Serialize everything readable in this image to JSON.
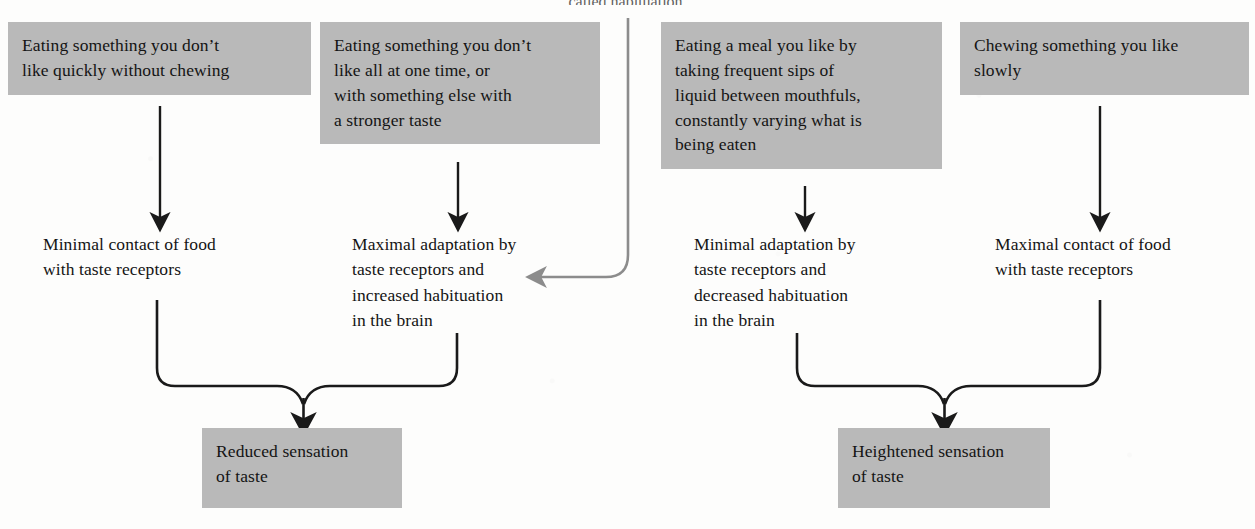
{
  "page": {
    "cutoff_heading": "called habituation.",
    "width": 1255,
    "height": 529
  },
  "colors": {
    "box_fill": "#b9b9b9",
    "text": "#141414",
    "arrow_black": "#1a1a1a",
    "arrow_gray": "#8c8c8c",
    "background": "#fdfdfc"
  },
  "nodes": {
    "cause_1": {
      "label": "Eating something you don’t\nlike quickly without chewing",
      "kind": "shaded-box"
    },
    "cause_2": {
      "label": "Eating something you don’t\nlike all at one time, or\nwith something else with\na stronger taste",
      "kind": "shaded-box"
    },
    "cause_3": {
      "label": "Eating a meal you like by\ntaking frequent sips of\nliquid between mouthfuls,\nconstantly varying what is\nbeing eaten",
      "kind": "shaded-box"
    },
    "cause_4": {
      "label": "Chewing something you like\nslowly",
      "kind": "shaded-box"
    },
    "effect_1": {
      "label": "Minimal contact of food\nwith taste receptors",
      "kind": "plain-label"
    },
    "effect_2": {
      "label": "Maximal adaptation by\ntaste receptors and\nincreased habituation\nin the brain",
      "kind": "plain-label"
    },
    "effect_3": {
      "label": "Minimal adaptation by\ntaste receptors and\ndecreased habituation\nin the brain",
      "kind": "plain-label"
    },
    "effect_4": {
      "label": "Maximal contact of food\nwith taste receptors",
      "kind": "plain-label"
    },
    "outcome_left": {
      "label": "Reduced sensation\nof taste",
      "kind": "shaded-box"
    },
    "outcome_right": {
      "label": "Heightened sensation\nof taste",
      "kind": "shaded-box"
    }
  },
  "connectors": [
    {
      "name": "arrow-cause1-to-effect1",
      "from": "cause_1",
      "to": "effect_1",
      "style": "straight-down",
      "color": "#1a1a1a"
    },
    {
      "name": "arrow-cause2-to-effect2",
      "from": "cause_2",
      "to": "effect_2",
      "style": "straight-down",
      "color": "#1a1a1a"
    },
    {
      "name": "arrow-habituation-to-effect2",
      "from": "cutoff_heading",
      "to": "effect_2",
      "style": "curved-down-left",
      "color": "#8c8c8c"
    },
    {
      "name": "arrow-cause3-to-effect3",
      "from": "cause_3",
      "to": "effect_3",
      "style": "straight-down",
      "color": "#1a1a1a"
    },
    {
      "name": "arrow-cause4-to-effect4",
      "from": "cause_4",
      "to": "effect_4",
      "style": "straight-down",
      "color": "#1a1a1a"
    },
    {
      "name": "merge-arrow-left-outcome",
      "from": "effect_1, effect_2",
      "to": "outcome_left",
      "style": "merging-bracket",
      "color": "#1a1a1a"
    },
    {
      "name": "merge-arrow-right-outcome",
      "from": "effect_3, effect_4",
      "to": "outcome_right",
      "style": "merging-bracket",
      "color": "#1a1a1a"
    }
  ]
}
